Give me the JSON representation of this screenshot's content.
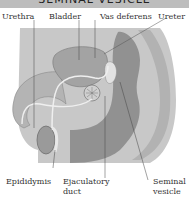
{
  "title": "SEMINAL VESICLE",
  "labels": {
    "urethra": "Urethra",
    "bladder": "Bladder",
    "vas_deferens": "Vas deferens",
    "ureter": "Ureter",
    "epididymis": "Epididymis",
    "ejaculatory_duct_1": "Ejaculatory",
    "ejaculatory_duct_2": "duct",
    "seminal_vesicle_1": "Seminal",
    "seminal_vesicle_2": "vesicle"
  },
  "colors": {
    "title_bg": "#bdbdbd",
    "body_fill": "#c4c4c4",
    "dark_fill": "#8f8f8f",
    "organ_fill": "#a8a8a8",
    "line": "#444444"
  }
}
